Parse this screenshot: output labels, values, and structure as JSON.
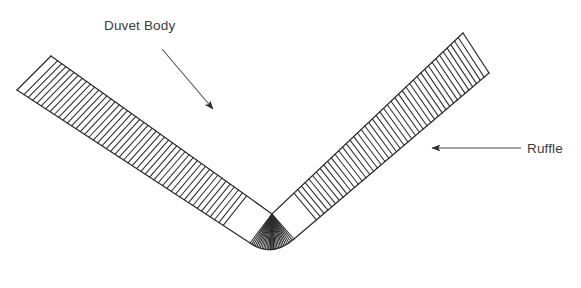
{
  "figure": {
    "background_color": "#ffffff",
    "stroke_color": "#2d2d2d",
    "text_color": "#3b3b3b",
    "width": 581,
    "height": 288
  },
  "annotations": [
    {
      "id": "duvet-body",
      "label": "Duvet Body",
      "text_x": 104,
      "text_y": 30,
      "arrow": {
        "from_x": 162,
        "from_y": 49,
        "to_x": 213,
        "to_y": 109
      }
    },
    {
      "id": "ruffle",
      "label": "Ruffle",
      "text_x": 527,
      "text_y": 153,
      "arrow": {
        "from_x": 521,
        "from_y": 148,
        "to_x": 432,
        "to_y": 148
      }
    }
  ],
  "shape": {
    "type": "v-band-with-hatching",
    "description": "V-shaped fabric band drawn as two long parallel edges with perpendicular ruffle hatch lines; lines fan radially at the bottom vertex",
    "vertex_inner_x": 272,
    "vertex_inner_y": 214,
    "vertex_outer_x": 272,
    "vertex_outer_y": 272,
    "left_inner_tip_x": 51,
    "left_inner_tip_y": 56,
    "left_outer_tip_x": 17,
    "left_outer_tip_y": 90,
    "right_inner_tip_x": 463,
    "right_inner_tip_y": 33,
    "right_outer_tip_x": 489,
    "right_outer_tip_y": 73,
    "hatch_count_left_arm": 46,
    "hatch_count_right_arm": 44,
    "hatch_count_fan": 26
  }
}
